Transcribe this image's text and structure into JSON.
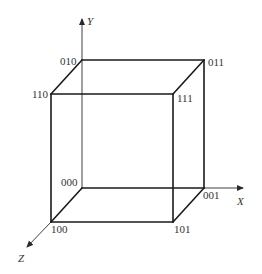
{
  "diagram": {
    "type": "unit-cube-binary-coordinates",
    "axes": {
      "x": {
        "label": "X"
      },
      "y": {
        "label": "Y"
      },
      "z": {
        "label": "Z"
      }
    },
    "vertices": {
      "v000": {
        "label": "000"
      },
      "v001": {
        "label": "001"
      },
      "v010": {
        "label": "010"
      },
      "v011": {
        "label": "011"
      },
      "v100": {
        "label": "100"
      },
      "v101": {
        "label": "101"
      },
      "v110": {
        "label": "110"
      },
      "v111": {
        "label": "111"
      }
    },
    "colors": {
      "line": "#1a1a1a",
      "text": "#333333",
      "background": "#ffffff"
    }
  }
}
